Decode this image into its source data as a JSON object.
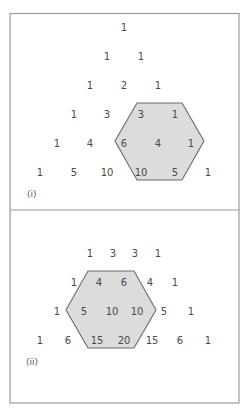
{
  "panels": [
    {
      "label": "(i)",
      "rows": [
        {
          "y": 27,
          "cells": [
            {
              "v": "1",
              "x": 124
            }
          ]
        },
        {
          "y": 56,
          "cells": [
            {
              "v": "1",
              "x": 107
            },
            {
              "v": "1",
              "x": 141
            }
          ]
        },
        {
          "y": 85,
          "cells": [
            {
              "v": "1",
              "x": 90
            },
            {
              "v": "2",
              "x": 124
            },
            {
              "v": "1",
              "x": 158
            }
          ]
        },
        {
          "y": 114,
          "cells": [
            {
              "v": "1",
              "x": 74
            },
            {
              "v": "3",
              "x": 107
            },
            {
              "v": "3",
              "x": 141
            },
            {
              "v": "1",
              "x": 175
            }
          ]
        },
        {
          "y": 143,
          "cells": [
            {
              "v": "1",
              "x": 57
            },
            {
              "v": "4",
              "x": 90
            },
            {
              "v": "6",
              "x": 124
            },
            {
              "v": "4",
              "x": 158
            },
            {
              "v": "1",
              "x": 191
            }
          ]
        },
        {
          "y": 172,
          "cells": [
            {
              "v": "1",
              "x": 40
            },
            {
              "v": "5",
              "x": 74
            },
            {
              "v": "10",
              "x": 107
            },
            {
              "v": "10",
              "x": 141
            },
            {
              "v": "5",
              "x": 175
            },
            {
              "v": "1",
              "x": 208
            }
          ]
        }
      ],
      "hexagon": "137,103 182,103 204,141 182,180 137,180 115,141",
      "label_pos": [
        27,
        197
      ]
    },
    {
      "label": "(ii)",
      "rows": [
        {
          "y": 253,
          "cells": [
            {
              "v": "1",
              "x": 90
            },
            {
              "v": "3",
              "x": 113
            },
            {
              "v": "3",
              "x": 135
            },
            {
              "v": "1",
              "x": 158
            }
          ]
        },
        {
          "y": 282,
          "cells": [
            {
              "v": "1",
              "x": 74
            },
            {
              "v": "4",
              "x": 99
            },
            {
              "v": "6",
              "x": 124
            },
            {
              "v": "4",
              "x": 150
            },
            {
              "v": "1",
              "x": 175
            }
          ]
        },
        {
          "y": 311,
          "cells": [
            {
              "v": "1",
              "x": 57
            },
            {
              "v": "5",
              "x": 84
            },
            {
              "v": "10",
              "x": 112
            },
            {
              "v": "10",
              "x": 137
            },
            {
              "v": "5",
              "x": 164
            },
            {
              "v": "1",
              "x": 191
            }
          ]
        },
        {
          "y": 340,
          "cells": [
            {
              "v": "1",
              "x": 40
            },
            {
              "v": "6",
              "x": 68
            },
            {
              "v": "15",
              "x": 97
            },
            {
              "v": "20",
              "x": 124
            },
            {
              "v": "15",
              "x": 152
            },
            {
              "v": "6",
              "x": 180
            },
            {
              "v": "1",
              "x": 208
            }
          ]
        }
      ],
      "hexagon": "88,271 134,271 156,310 134,348 88,348 66,310",
      "label_pos": [
        26,
        365
      ]
    }
  ],
  "colors": {
    "frame": "#9a9a9a",
    "hex_fill": "#dcdcdc",
    "hex_stroke": "#6a6a6a",
    "text": "#4a4a4a"
  }
}
